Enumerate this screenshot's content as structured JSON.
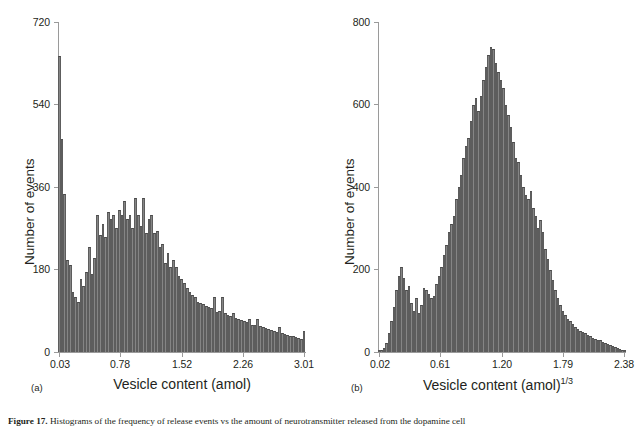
{
  "figure": {
    "caption_prefix": "Figure 17.",
    "caption_text": " Histograms of the frequency of release events vs the amount of neurotransmitter released from the dopamine cell"
  },
  "panels": [
    {
      "tag": "(a)",
      "xlabel": "Vesicle content (amol)",
      "xlabel_sup": "",
      "ylabel": "Number of events",
      "xticks": [
        "0.03",
        "0.78",
        "1.52",
        "2.26",
        "3.01"
      ],
      "yticks": [
        "0",
        "180",
        "360",
        "540",
        "720"
      ]
    },
    {
      "tag": "(b)",
      "xlabel": "Vesicle content (amol)",
      "xlabel_sup": "1/3",
      "ylabel": "Number of events",
      "xticks": [
        "0.02",
        "0.61",
        "1.20",
        "1.79",
        "2.38"
      ],
      "yticks": [
        "0",
        "200",
        "400",
        "600",
        "800"
      ]
    }
  ],
  "colors": {
    "bar_fill": "#858585",
    "bar_edge": "#5d5d5d",
    "axis": "#9a9a9a",
    "text": "#231f20"
  },
  "chart_data": [
    {
      "type": "bar",
      "title": "",
      "panel": "(a)",
      "xlabel": "Vesicle content (amol)",
      "ylabel": "Number of events",
      "xlim": [
        0.03,
        3.07
      ],
      "ylim": [
        0,
        720
      ],
      "xtick_values": [
        0.03,
        0.78,
        1.52,
        2.26,
        3.01
      ],
      "ytick_values": [
        0,
        180,
        360,
        540,
        720
      ],
      "grid": false,
      "legend": "none",
      "bin_width": 0.0335,
      "x": [
        0.03,
        0.063,
        0.097,
        0.13,
        0.164,
        0.197,
        0.231,
        0.264,
        0.298,
        0.331,
        0.365,
        0.398,
        0.432,
        0.465,
        0.499,
        0.532,
        0.566,
        0.599,
        0.633,
        0.666,
        0.7,
        0.733,
        0.767,
        0.8,
        0.834,
        0.867,
        0.901,
        0.934,
        0.968,
        1.001,
        1.035,
        1.068,
        1.102,
        1.135,
        1.169,
        1.202,
        1.236,
        1.269,
        1.303,
        1.336,
        1.37,
        1.403,
        1.437,
        1.47,
        1.504,
        1.537,
        1.571,
        1.604,
        1.638,
        1.671,
        1.705,
        1.738,
        1.772,
        1.805,
        1.839,
        1.872,
        1.906,
        1.939,
        1.973,
        2.006,
        2.04,
        2.073,
        2.107,
        2.14,
        2.174,
        2.207,
        2.241,
        2.274,
        2.308,
        2.341,
        2.375,
        2.408,
        2.442,
        2.475,
        2.509,
        2.542,
        2.576,
        2.609,
        2.643,
        2.676,
        2.71,
        2.743,
        2.777,
        2.81,
        2.844,
        2.877,
        2.911,
        2.944,
        2.978,
        3.011,
        3.045
      ],
      "values": [
        645,
        465,
        345,
        200,
        190,
        130,
        120,
        110,
        160,
        145,
        175,
        230,
        170,
        205,
        300,
        255,
        280,
        250,
        305,
        290,
        300,
        270,
        310,
        300,
        330,
        290,
        300,
        270,
        335,
        300,
        275,
        335,
        260,
        290,
        300,
        260,
        265,
        230,
        235,
        195,
        215,
        185,
        200,
        185,
        165,
        160,
        150,
        140,
        130,
        125,
        120,
        110,
        108,
        105,
        100,
        98,
        95,
        120,
        88,
        90,
        120,
        85,
        80,
        78,
        85,
        75,
        72,
        70,
        68,
        66,
        72,
        60,
        58,
        72,
        56,
        55,
        52,
        50,
        48,
        46,
        44,
        55,
        42,
        40,
        38,
        36,
        34,
        32,
        30,
        28,
        45
      ]
    },
    {
      "type": "bar",
      "title": "",
      "panel": "(b)",
      "xlabel": "Vesicle content (amol)^1/3",
      "ylabel": "Number of events",
      "xlim": [
        0.02,
        2.38
      ],
      "ylim": [
        0,
        800
      ],
      "xtick_values": [
        0.02,
        0.61,
        1.2,
        1.79,
        2.38
      ],
      "ytick_values": [
        0,
        200,
        400,
        600,
        800
      ],
      "grid": false,
      "legend": "none",
      "bin_width": 0.0236,
      "x": [
        0.02,
        0.044,
        0.067,
        0.091,
        0.114,
        0.138,
        0.161,
        0.185,
        0.208,
        0.232,
        0.256,
        0.279,
        0.303,
        0.326,
        0.35,
        0.373,
        0.397,
        0.42,
        0.444,
        0.468,
        0.491,
        0.515,
        0.538,
        0.562,
        0.585,
        0.609,
        0.632,
        0.656,
        0.68,
        0.703,
        0.727,
        0.75,
        0.774,
        0.797,
        0.821,
        0.844,
        0.868,
        0.892,
        0.915,
        0.939,
        0.962,
        0.986,
        1.009,
        1.033,
        1.057,
        1.08,
        1.104,
        1.127,
        1.151,
        1.174,
        1.198,
        1.221,
        1.245,
        1.269,
        1.292,
        1.316,
        1.339,
        1.363,
        1.386,
        1.41,
        1.433,
        1.457,
        1.481,
        1.504,
        1.528,
        1.551,
        1.575,
        1.598,
        1.622,
        1.645,
        1.669,
        1.693,
        1.716,
        1.74,
        1.763,
        1.787,
        1.81,
        1.834,
        1.857,
        1.881,
        1.905,
        1.928,
        1.952,
        1.975,
        1.999,
        2.022,
        2.046,
        2.069,
        2.093,
        2.117,
        2.14,
        2.164,
        2.187,
        2.211,
        2.234,
        2.258,
        2.281,
        2.305,
        2.329,
        2.352
      ],
      "values": [
        3,
        5,
        10,
        22,
        45,
        75,
        110,
        150,
        185,
        205,
        180,
        150,
        160,
        120,
        100,
        130,
        95,
        115,
        155,
        150,
        140,
        130,
        135,
        165,
        185,
        205,
        235,
        260,
        290,
        310,
        330,
        370,
        400,
        430,
        470,
        500,
        520,
        560,
        600,
        615,
        585,
        620,
        660,
        690,
        720,
        740,
        735,
        700,
        680,
        660,
        640,
        600,
        575,
        545,
        510,
        470,
        460,
        430,
        400,
        380,
        370,
        390,
        350,
        330,
        300,
        320,
        290,
        250,
        225,
        200,
        175,
        150,
        130,
        115,
        100,
        90,
        80,
        75,
        68,
        60,
        55,
        50,
        48,
        45,
        42,
        38,
        35,
        32,
        30,
        28,
        25,
        22,
        20,
        18,
        15,
        12,
        10,
        8,
        6,
        4
      ]
    }
  ]
}
